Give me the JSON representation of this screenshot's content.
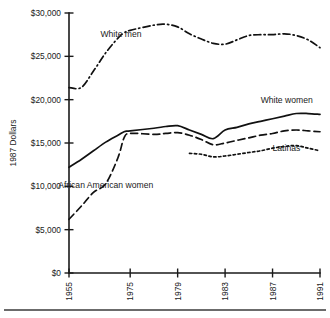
{
  "chart_data": {
    "type": "line",
    "title": "",
    "subtitle": "",
    "xlabel": "",
    "ylabel": "1987 Dollars",
    "grid": false,
    "legend_position": "inline-labels",
    "xlim": [
      1955,
      1991
    ],
    "ylim": [
      0,
      30000
    ],
    "y_ticks": [
      0,
      5000,
      10000,
      15000,
      20000,
      25000,
      30000
    ],
    "y_tick_labels": [
      "$0",
      "$5,000",
      "$10,000",
      "$15,000",
      "$20,000",
      "$25,000",
      "$30,000"
    ],
    "x_ticks": [
      1955,
      1975,
      1979,
      1983,
      1987,
      1991
    ],
    "x_tick_labels": [
      "1955",
      "1975",
      "1979",
      "1983",
      "1987",
      "1991"
    ],
    "axis_note": "x axis is not linear: 1955 sits at the left edge and 1975 at roughly one fifth across, then 4-year steps are evenly spaced",
    "series": [
      {
        "name": "White men",
        "line_style": "dash-dot",
        "label_x": 1972,
        "label_y": 27200,
        "x": [
          1955,
          1959,
          1963,
          1967,
          1971,
          1973,
          1975,
          1977,
          1978,
          1979,
          1980,
          1981,
          1982,
          1983,
          1984,
          1985,
          1986,
          1987,
          1988,
          1989,
          1990,
          1991
        ],
        "values": [
          21400,
          21400,
          23300,
          25400,
          27100,
          27700,
          28000,
          28600,
          28700,
          28400,
          27600,
          27000,
          26500,
          26400,
          26900,
          27400,
          27500,
          27500,
          27600,
          27400,
          26900,
          26000
        ]
      },
      {
        "name": "White women",
        "line_style": "solid",
        "label_x": 1986,
        "label_y": 19600,
        "x": [
          1955,
          1959,
          1963,
          1967,
          1971,
          1973,
          1975,
          1977,
          1978,
          1979,
          1980,
          1981,
          1982,
          1983,
          1984,
          1985,
          1986,
          1987,
          1988,
          1989,
          1990,
          1991
        ],
        "values": [
          12200,
          13100,
          14100,
          15100,
          15900,
          16300,
          16400,
          16700,
          16900,
          17000,
          16500,
          16000,
          15500,
          16500,
          16800,
          17200,
          17500,
          17800,
          18100,
          18400,
          18400,
          18300
        ]
      },
      {
        "name": "African American women",
        "line_style": "long-dash",
        "label_x": 1967,
        "label_y": 9800,
        "x": [
          1955,
          1959,
          1963,
          1967,
          1971,
          1973,
          1975,
          1977,
          1978,
          1979,
          1980,
          1981,
          1982,
          1983,
          1984,
          1985,
          1986,
          1987,
          1988,
          1989,
          1990,
          1991
        ],
        "values": [
          6200,
          7700,
          9300,
          10300,
          13300,
          15600,
          16100,
          16000,
          16100,
          16200,
          15900,
          15400,
          14800,
          15000,
          15300,
          15600,
          15900,
          16100,
          16400,
          16500,
          16400,
          16300
        ]
      },
      {
        "name": "Latinas",
        "line_style": "dotted",
        "label_x": 1987,
        "label_y": 14100,
        "x": [
          1980,
          1981,
          1982,
          1983,
          1984,
          1985,
          1986,
          1987,
          1988,
          1989,
          1990,
          1991
        ],
        "values": [
          13800,
          13700,
          13400,
          13500,
          13700,
          13900,
          14100,
          14400,
          14600,
          14700,
          14400,
          14100
        ]
      }
    ]
  },
  "figure": {
    "has_footer_rule": true
  }
}
